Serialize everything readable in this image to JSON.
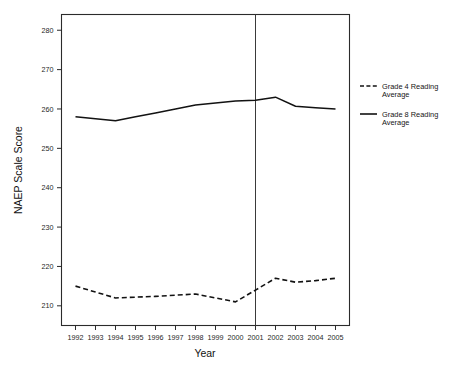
{
  "chart_data": {
    "type": "line",
    "title": "",
    "xlabel": "Year",
    "ylabel": "NAEP Scale Score",
    "x": [
      1992,
      1993,
      1994,
      1995,
      1996,
      1997,
      1998,
      1999,
      2000,
      2001,
      2002,
      2003,
      2004,
      2005
    ],
    "xtick_labels": [
      "1992",
      "1993",
      "1994",
      "1995",
      "1996",
      "1997",
      "1998",
      "1999",
      "2000",
      "2001",
      "2002",
      "2003",
      "2004",
      "2005"
    ],
    "ytick_labels": [
      "210",
      "220",
      "230",
      "240",
      "250",
      "260",
      "270",
      "280"
    ],
    "yticks": [
      210,
      220,
      230,
      240,
      250,
      260,
      270,
      280
    ],
    "ylim": [
      205,
      284
    ],
    "xlim": [
      1991.3,
      2005.7
    ],
    "grid": false,
    "legend_position": "right",
    "series": [
      {
        "name": "Grade 4 Reading Average",
        "style": "dashed",
        "color": "#121212",
        "x": [
          1992,
          1994,
          1998,
          2000,
          2002,
          2003,
          2005
        ],
        "values": [
          215,
          212,
          213,
          211,
          217,
          216,
          217
        ],
        "points": [
          {
            "year": 1992,
            "value": 215
          },
          {
            "year": 1993,
            "value": 213.5
          },
          {
            "year": 1994,
            "value": 212
          },
          {
            "year": 1995,
            "value": 212.2
          },
          {
            "year": 1996,
            "value": 212.4
          },
          {
            "year": 1997,
            "value": 212.7
          },
          {
            "year": 1998,
            "value": 213
          },
          {
            "year": 1999,
            "value": 212
          },
          {
            "year": 2000,
            "value": 211
          },
          {
            "year": 2001,
            "value": 214
          },
          {
            "year": 2002,
            "value": 217
          },
          {
            "year": 2003,
            "value": 216
          },
          {
            "year": 2004,
            "value": 216.4
          },
          {
            "year": 2005,
            "value": 217
          }
        ]
      },
      {
        "name": "Grade 8 Reading Average",
        "style": "solid",
        "color": "#121212",
        "x": [
          1992,
          1994,
          1998,
          2002,
          2003,
          2005
        ],
        "values": [
          258,
          257,
          261,
          263,
          260.5,
          260
        ],
        "points": [
          {
            "year": 1992,
            "value": 258
          },
          {
            "year": 1993,
            "value": 257.5
          },
          {
            "year": 1994,
            "value": 257
          },
          {
            "year": 1995,
            "value": 258
          },
          {
            "year": 1996,
            "value": 259
          },
          {
            "year": 1997,
            "value": 260
          },
          {
            "year": 1998,
            "value": 261
          },
          {
            "year": 1999,
            "value": 261.5
          },
          {
            "year": 2000,
            "value": 262
          },
          {
            "year": 2001,
            "value": 262.2
          },
          {
            "year": 2002,
            "value": 263
          },
          {
            "year": 2003,
            "value": 260.7
          },
          {
            "year": 2004,
            "value": 260.3
          },
          {
            "year": 2005,
            "value": 260
          }
        ]
      }
    ],
    "annotations": [
      {
        "type": "vertical-reference-line",
        "x": 2001,
        "label": "2001"
      }
    ]
  },
  "legend": {
    "items": [
      {
        "label_line1": "Grade 4 Reading",
        "label_line2": "Average",
        "style": "dashed"
      },
      {
        "label_line1": "Grade 8 Reading",
        "label_line2": "Average",
        "style": "solid"
      }
    ]
  },
  "axes": {
    "x_title": "Year",
    "y_title": "NAEP Scale Score"
  }
}
